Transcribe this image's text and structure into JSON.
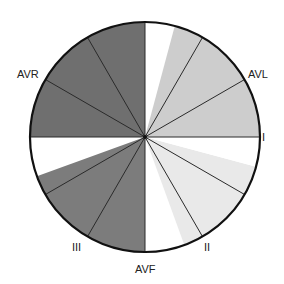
{
  "diagram": {
    "type": "hexaxial-reference-circle",
    "center": [
      145,
      137
    ],
    "radius": 115,
    "colors": {
      "outline": "#111111",
      "spoke": "#2a2a2a",
      "dark_gray": "#6f6f6f",
      "medium_gray": "#7c7c7c",
      "light_gray": "#cdcdcd",
      "very_light_gray": "#e9e9e9",
      "white": "#ffffff"
    },
    "spoke_angles_deg": [
      0,
      30,
      60,
      90,
      120,
      150,
      180,
      210,
      240,
      270,
      300,
      330
    ],
    "sectors": [
      {
        "name": "upper-right-white",
        "from": 270,
        "to": 285,
        "color": "#ffffff"
      },
      {
        "name": "upper-right-light",
        "from": 285,
        "to": 360,
        "color": "#cdcdcd"
      },
      {
        "name": "upper-left-dark",
        "from": 180,
        "to": 270,
        "color": "#6f6f6f"
      },
      {
        "name": "left-white",
        "from": 160,
        "to": 180,
        "color": "#ffffff"
      },
      {
        "name": "lower-left-medium",
        "from": 90,
        "to": 160,
        "color": "#7c7c7c"
      },
      {
        "name": "bottom-white",
        "from": 70,
        "to": 90,
        "color": "#ffffff"
      },
      {
        "name": "lower-right-very-light",
        "from": 15,
        "to": 70,
        "color": "#e9e9e9"
      },
      {
        "name": "right-white",
        "from": 0,
        "to": 15,
        "color": "#ffffff"
      }
    ],
    "labels": [
      {
        "text": "AVR",
        "x": 17,
        "y": 78
      },
      {
        "text": "AVL",
        "x": 248,
        "y": 78
      },
      {
        "text": "I",
        "x": 262,
        "y": 141
      },
      {
        "text": "III",
        "x": 72,
        "y": 251
      },
      {
        "text": "AVF",
        "x": 135,
        "y": 273
      },
      {
        "text": "II",
        "x": 204,
        "y": 251
      }
    ]
  }
}
